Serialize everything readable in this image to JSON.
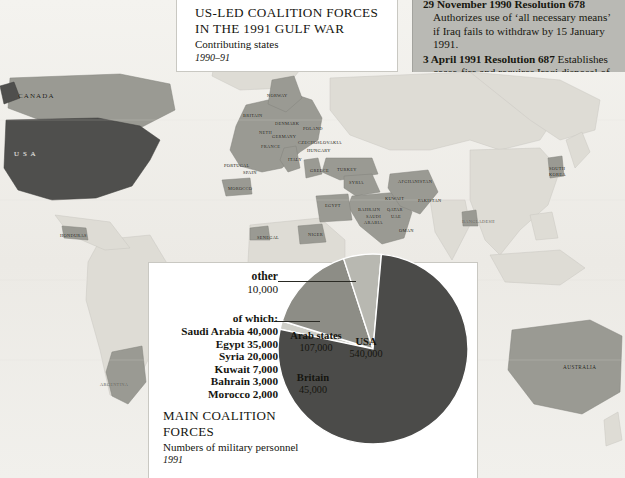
{
  "title_panel": {
    "line1": "US-LED COALITION FORCES",
    "line2": "IN THE 1991 GULF WAR",
    "subtitle": "Contributing states",
    "date": "1990–91"
  },
  "resolutions_panel": {
    "items": [
      {
        "head": "29 November 1990 Resolution 678",
        "body": "Authorizes use of ‘all necessary means’ if Iraq fails to withdraw by 15 January 1991."
      },
      {
        "head": "3 April 1991 Resolution 687",
        "body": "Establishes cease-fire and requires Iraqi disposal of WMD."
      }
    ]
  },
  "chart_caption": {
    "line1": "MAIN COALITION",
    "line2": "FORCES",
    "subtitle": "Numbers of military personnel",
    "date": "1991"
  },
  "legend": {
    "other_name": "other",
    "other_value": "10,000",
    "of_which_label": "of which:",
    "rows": [
      {
        "country": "Saudi Arabia",
        "value": "40,000"
      },
      {
        "country": "Egypt",
        "value": "35,000"
      },
      {
        "country": "Syria",
        "value": "20,000"
      },
      {
        "country": "Kuwait",
        "value": "7,000"
      },
      {
        "country": "Bahrain",
        "value": "3,000"
      },
      {
        "country": "Morocco",
        "value": "2,000"
      }
    ]
  },
  "chart_data": {
    "type": "pie",
    "title": "MAIN COALITION FORCES",
    "subtitle": "Numbers of military personnel",
    "date": "1991",
    "unit": "military personnel",
    "total": 702000,
    "slices": [
      {
        "label": "USA",
        "value": 540000,
        "display_value": "540,000",
        "color": "#4b4b49",
        "label_inside": true
      },
      {
        "label": "Arab states",
        "value": 107000,
        "display_value": "107,000",
        "color": "#8d8d86",
        "label_inside": true
      },
      {
        "label": "Britain",
        "value": 45000,
        "display_value": "45,000",
        "color": "#b8b8b1",
        "label_inside": true
      },
      {
        "label": "other",
        "value": 10000,
        "display_value": "10,000",
        "color": "#cfcfc8",
        "label_inside": false
      }
    ],
    "breakdown": {
      "parent": "Arab states",
      "items": [
        {
          "label": "Saudi Arabia",
          "value": 40000,
          "display_value": "40,000"
        },
        {
          "label": "Egypt",
          "value": 35000,
          "display_value": "35,000"
        },
        {
          "label": "Syria",
          "value": 20000,
          "display_value": "20,000"
        },
        {
          "label": "Kuwait",
          "value": 7000,
          "display_value": "7,000"
        },
        {
          "label": "Bahrain",
          "value": 3000,
          "display_value": "3,000"
        },
        {
          "label": "Morocco",
          "value": 2000,
          "display_value": "2,000"
        }
      ]
    },
    "legend_position": "left",
    "grid": false
  },
  "map": {
    "colors": {
      "usa": "#4f4f4d",
      "coalition": "#9a9a93",
      "neutral": "#dedcd5",
      "ocean": "#f2f1ed"
    },
    "labels": [
      {
        "name": "CANADA",
        "x": 18,
        "y": 92,
        "size": "med"
      },
      {
        "name": "U S A",
        "x": 14,
        "y": 150,
        "size": "med",
        "tone": "onwhite"
      },
      {
        "name": "HONDURAS",
        "x": 60,
        "y": 233,
        "size": "tiny"
      },
      {
        "name": "ARGENTINA",
        "x": 100,
        "y": 382,
        "size": "tiny",
        "tone": "light"
      },
      {
        "name": "NORWAY",
        "x": 267,
        "y": 93,
        "size": "tiny"
      },
      {
        "name": "BRITAIN",
        "x": 243,
        "y": 113,
        "size": "tiny"
      },
      {
        "name": "DENMARK",
        "x": 275,
        "y": 121,
        "size": "tiny"
      },
      {
        "name": "NETH",
        "x": 259,
        "y": 130,
        "size": "tiny"
      },
      {
        "name": "GERMANY",
        "x": 272,
        "y": 134,
        "size": "tiny"
      },
      {
        "name": "POLAND",
        "x": 303,
        "y": 126,
        "size": "tiny"
      },
      {
        "name": "CZECHOSLOVAKIA",
        "x": 298,
        "y": 140,
        "size": "tiny"
      },
      {
        "name": "FRANCE",
        "x": 261,
        "y": 144,
        "size": "tiny"
      },
      {
        "name": "HUNGARY",
        "x": 307,
        "y": 148,
        "size": "tiny"
      },
      {
        "name": "ITALY",
        "x": 288,
        "y": 157,
        "size": "tiny"
      },
      {
        "name": "PORTUGAL",
        "x": 224,
        "y": 163,
        "size": "tiny"
      },
      {
        "name": "SPAIN",
        "x": 243,
        "y": 170,
        "size": "tiny"
      },
      {
        "name": "GREECE",
        "x": 310,
        "y": 168,
        "size": "tiny"
      },
      {
        "name": "TURKEY",
        "x": 337,
        "y": 167,
        "size": "tiny"
      },
      {
        "name": "MOROCCO",
        "x": 228,
        "y": 186,
        "size": "tiny"
      },
      {
        "name": "SYRIA",
        "x": 349,
        "y": 180,
        "size": "tiny"
      },
      {
        "name": "EGYPT",
        "x": 325,
        "y": 203,
        "size": "tiny"
      },
      {
        "name": "KUWAIT",
        "x": 385,
        "y": 196,
        "size": "tiny"
      },
      {
        "name": "BAHRAIN",
        "x": 358,
        "y": 207,
        "size": "tiny"
      },
      {
        "name": "QATAR",
        "x": 387,
        "y": 207,
        "size": "tiny"
      },
      {
        "name": "UAE",
        "x": 391,
        "y": 214,
        "size": "tiny"
      },
      {
        "name": "SAUDI",
        "x": 366,
        "y": 214,
        "size": "tiny"
      },
      {
        "name": "ARABIA",
        "x": 364,
        "y": 220,
        "size": "tiny"
      },
      {
        "name": "OMAN",
        "x": 399,
        "y": 228,
        "size": "tiny"
      },
      {
        "name": "AFGHANISTAN",
        "x": 398,
        "y": 179,
        "size": "tiny"
      },
      {
        "name": "PAKISTAN",
        "x": 418,
        "y": 198,
        "size": "tiny"
      },
      {
        "name": "BANGLADESH",
        "x": 462,
        "y": 219,
        "size": "tiny",
        "tone": "light"
      },
      {
        "name": "SENEGAL",
        "x": 257,
        "y": 235,
        "size": "tiny"
      },
      {
        "name": "NIGER",
        "x": 308,
        "y": 232,
        "size": "tiny"
      },
      {
        "name": "SOUTH",
        "x": 549,
        "y": 166,
        "size": "tiny"
      },
      {
        "name": "KOREA",
        "x": 549,
        "y": 172,
        "size": "tiny"
      },
      {
        "name": "AUSTRALIA",
        "x": 563,
        "y": 364,
        "size": "small"
      }
    ]
  }
}
